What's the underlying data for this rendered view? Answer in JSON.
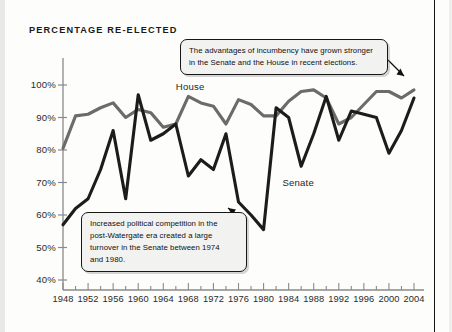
{
  "chart_data": {
    "type": "line",
    "title": "PERCENTAGE RE-ELECTED",
    "xlabel": "",
    "ylabel": "",
    "ylim": [
      40,
      100
    ],
    "xlim": [
      1948,
      2004
    ],
    "grid": false,
    "legend_position": "inline-labels",
    "ytick_labels": [
      "100%",
      "90%",
      "80%",
      "70%",
      "60%",
      "50%",
      "40%"
    ],
    "ytick_values": [
      100,
      90,
      80,
      70,
      60,
      50,
      40
    ],
    "xtick_labels": [
      "1948",
      "1952",
      "1956",
      "1960",
      "1964",
      "1968",
      "1972",
      "1976",
      "1980",
      "1984",
      "1988",
      "1992",
      "1996",
      "2000",
      "2004"
    ],
    "xtick_values": [
      1948,
      1952,
      1956,
      1960,
      1964,
      1968,
      1972,
      1976,
      1980,
      1984,
      1988,
      1992,
      1996,
      2000,
      2004
    ],
    "minor_tick_interval_years": 2,
    "x": [
      1948,
      1950,
      1952,
      1954,
      1956,
      1958,
      1960,
      1962,
      1964,
      1966,
      1968,
      1970,
      1972,
      1974,
      1976,
      1978,
      1980,
      1982,
      1984,
      1986,
      1988,
      1990,
      1992,
      1994,
      1996,
      1998,
      2000,
      2002,
      2004
    ],
    "series": [
      {
        "name": "House",
        "color": "#6b6b6b",
        "values": [
          80.5,
          90.5,
          91.0,
          93.0,
          94.5,
          90.0,
          92.5,
          91.5,
          87.0,
          88.0,
          96.5,
          94.5,
          93.5,
          88.0,
          95.5,
          94.0,
          90.5,
          90.5,
          95.0,
          98.0,
          98.5,
          96.0,
          88.0,
          90.0,
          94.0,
          98.0,
          98.0,
          96.0,
          98.5
        ],
        "label_x": 1966,
        "label_y": 99.5
      },
      {
        "name": "Senate",
        "color": "#1c1c1c",
        "values": [
          57.0,
          62.0,
          65.0,
          74.0,
          86.0,
          65.0,
          97.0,
          83.0,
          85.0,
          88.0,
          72.0,
          77.0,
          74.0,
          85.0,
          64.0,
          60.0,
          55.5,
          93.0,
          90.0,
          75.0,
          85.0,
          96.5,
          83.0,
          92.0,
          91.0,
          90.0,
          79.0,
          86.0,
          96.0
        ],
        "label_x": 1983,
        "label_y": 70.0
      }
    ],
    "annotations": [
      {
        "id": "callout-top",
        "lines": [
          "The advantages of incumbency have grown stronger",
          "in the Senate and the House in recent elections."
        ],
        "points_to_year": 2004,
        "points_to_value": 99
      },
      {
        "id": "callout-bottom",
        "lines": [
          "Increased political competition in the",
          "post-Watergate era created a large",
          "turnover in the Senate between 1974",
          "and 1980."
        ],
        "points_to_year": 1978,
        "points_to_value": 60
      }
    ]
  }
}
